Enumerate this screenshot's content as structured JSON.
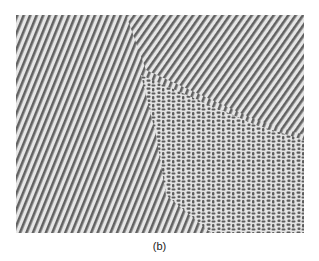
{
  "figure": {
    "colors": {
      "light": "#e6e6e6",
      "dark": "#4a4a4a",
      "mid": "#9a9a9a"
    }
  },
  "caption": "(b)"
}
